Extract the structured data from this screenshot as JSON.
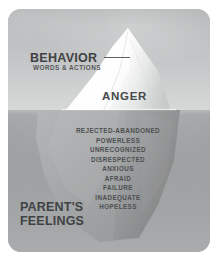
{
  "diagram": {
    "type": "iceberg-model",
    "above_water": {
      "headline": "BEHAVIOR",
      "subhead": "WORDS & ACTIONS",
      "visible_emotion": "ANGER"
    },
    "below_water": {
      "headline_line1": "PARENT'S",
      "headline_line2": "FEELINGS",
      "feelings": [
        "REJECTED-ABANDONED",
        "POWERLESS",
        "UNRECOGNIZED",
        "DISRESPECTED",
        "ANXIOUS",
        "AFRAID",
        "FAILURE",
        "INADEQUATE",
        "HOPELESS"
      ]
    },
    "colors": {
      "sky": "#c8cacb",
      "water": "#a1a3a4",
      "ice_above": "#f7f8f8",
      "ice_below": "#9a9c9d",
      "text_dark": "#3e4142",
      "text_muted": "#4c4f51",
      "card_border": "#b3b5b6"
    }
  }
}
